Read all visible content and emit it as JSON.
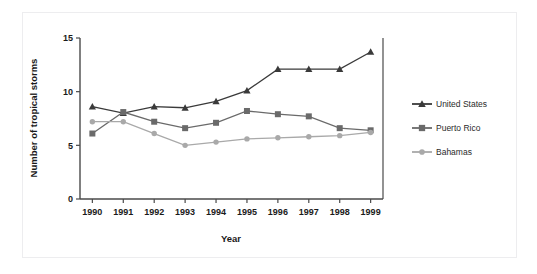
{
  "chart_data": {
    "type": "line",
    "title": "",
    "xlabel": "Year",
    "ylabel": "Number of tropical storms",
    "categories": [
      "1990",
      "1991",
      "1992",
      "1993",
      "1994",
      "1995",
      "1996",
      "1997",
      "1998",
      "1999"
    ],
    "x": [
      1990,
      1991,
      1992,
      1993,
      1994,
      1995,
      1996,
      1997,
      1998,
      1999
    ],
    "xlim": [
      1989.6,
      1999.4
    ],
    "ylim": [
      0,
      15
    ],
    "yticks": [
      0,
      5,
      10,
      15
    ],
    "ytick_labels": [
      "0",
      "5",
      "10",
      "15"
    ],
    "grid": false,
    "legend_position": "right",
    "series": [
      {
        "name": "United States",
        "marker": "triangle",
        "color": "#3a3a3a",
        "values": [
          8.6,
          8.0,
          8.6,
          8.5,
          9.1,
          10.1,
          12.1,
          12.1,
          12.1,
          13.7
        ]
      },
      {
        "name": "Puerto Rico",
        "marker": "square",
        "color": "#6a6a6a",
        "values": [
          6.1,
          8.1,
          7.2,
          6.6,
          7.1,
          8.2,
          7.9,
          7.7,
          6.6,
          6.4
        ]
      },
      {
        "name": "Bahamas",
        "marker": "circle",
        "color": "#a9a9a9",
        "values": [
          7.2,
          7.2,
          6.1,
          5.0,
          5.3,
          5.6,
          5.7,
          5.8,
          5.9,
          6.2
        ]
      }
    ]
  },
  "axes": {
    "x_title": "Year",
    "y_title": "Number of tropical storms"
  },
  "legend": {
    "entries": [
      {
        "label": "United States"
      },
      {
        "label": "Puerto Rico"
      },
      {
        "label": "Bahamas"
      }
    ]
  },
  "colors": {
    "series_united_states": "#3a3a3a",
    "series_puerto_rico": "#6a6a6a",
    "series_bahamas": "#a9a9a9",
    "axis": "#4a4a4a",
    "frame": "#ededef",
    "background": "#ffffff"
  }
}
